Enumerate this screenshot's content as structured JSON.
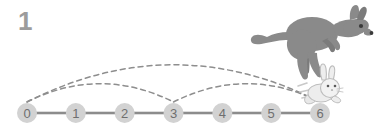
{
  "figure": {
    "question_number": "1",
    "background_color": "#ffffff"
  },
  "number_line": {
    "axis_color": "#8c8c8c",
    "node_fill": "#d2d2d2",
    "node_text_color": "#6f6f6f",
    "start_x": 27,
    "end_x": 320,
    "y": 113,
    "node_radius": 10,
    "ticks": [
      {
        "label": "0",
        "value": 0
      },
      {
        "label": "1",
        "value": 1
      },
      {
        "label": "2",
        "value": 2
      },
      {
        "label": "3",
        "value": 3
      },
      {
        "label": "4",
        "value": 4
      },
      {
        "label": "5",
        "value": 5
      },
      {
        "label": "6",
        "value": 6
      }
    ]
  },
  "jump_arcs": {
    "stroke_color": "#8e8e8e",
    "dash_pattern": "5,4",
    "arcs": [
      {
        "name": "kangaroo-jump-0-to-6",
        "from": 0,
        "to": 6,
        "apex_y": 41,
        "animal": "kangaroo"
      },
      {
        "name": "rabbit-jump-0-to-3",
        "from": 0,
        "to": 3,
        "apex_y": 72,
        "animal": "rabbit"
      },
      {
        "name": "rabbit-jump-3-to-6",
        "from": 3,
        "to": 6,
        "apex_y": 72,
        "animal": "rabbit"
      }
    ]
  },
  "animals": [
    {
      "name": "kangaroo",
      "body_color": "#8a8a8a",
      "detail_color": "#6e6e6e",
      "eye_color": "#3a3a3a",
      "position_x": 330,
      "position_y": 42
    },
    {
      "name": "rabbit",
      "body_color": "#e8e8e8",
      "outline_color": "#b9b9b9",
      "eye_color": "#5a5a5a",
      "position_x": 324,
      "position_y": 92
    }
  ]
}
